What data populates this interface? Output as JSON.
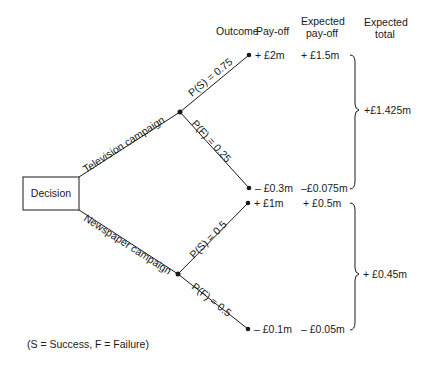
{
  "headers": {
    "outcome": "Outcome",
    "payoff": "Pay-off",
    "expected_payoff_1": "Expected",
    "expected_payoff_2": "pay-off",
    "expected_total_1": "Expected",
    "expected_total_2": "total"
  },
  "decision_node": {
    "label": "Decision"
  },
  "branches": [
    {
      "label": "Television campaign",
      "outcomes": [
        {
          "prob_label": "P(S) = 0.75",
          "payoff": "+ £2m",
          "expected_payoff": "+ £1.5m"
        },
        {
          "prob_label": "P(F) = 0.25",
          "payoff": "– £0.3m",
          "expected_payoff": "–£0.075m"
        }
      ],
      "expected_total": "+£1.425m"
    },
    {
      "label": "Newspaper campaign",
      "outcomes": [
        {
          "prob_label": "P(S) = 0.5",
          "payoff": "+ £1m",
          "expected_payoff": "+ £0.5m"
        },
        {
          "prob_label": "P(F) = 0.5",
          "payoff": "– £0.1m",
          "expected_payoff": "– £0.05m"
        }
      ],
      "expected_total": "+ £0.45m"
    }
  ],
  "legend": "(S = Success, F = Failure)",
  "colors": {
    "ink": "#1a1a1a",
    "background": "#ffffff"
  }
}
